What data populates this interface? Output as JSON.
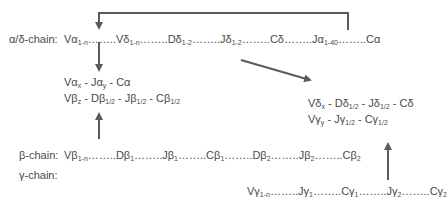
{
  "diagram": {
    "title": "",
    "colors": {
      "text": "#4a4a4a",
      "arrow": "#5a5a5a",
      "background": "#ffffff"
    },
    "alpha_delta_chain": {
      "label": "α/δ-chain:",
      "segments": [
        {
          "base": "Vα",
          "sub": "1-n"
        },
        {
          "base": "Vδ",
          "sub": "1-n"
        },
        {
          "base": "Dδ",
          "sub": "1-2"
        },
        {
          "base": "Jδ",
          "sub": "1-2"
        },
        {
          "base": "Cδ",
          "sub": ""
        },
        {
          "base": "Jα",
          "sub": "1-40"
        },
        {
          "base": "Cα",
          "sub": ""
        }
      ],
      "separator": "……."
    },
    "beta_chain": {
      "label": "β-chain:",
      "segments": [
        {
          "base": "Vβ",
          "sub": "1-n"
        },
        {
          "base": "Dβ",
          "sub": "1"
        },
        {
          "base": "Jβ",
          "sub": "1"
        },
        {
          "base": "Cβ",
          "sub": "1"
        },
        {
          "base": "Dβ",
          "sub": "2"
        },
        {
          "base": "Jβ",
          "sub": "2"
        },
        {
          "base": "Cβ",
          "sub": "2"
        }
      ]
    },
    "gamma_chain": {
      "label": "γ-chain:",
      "segments": [
        {
          "base": "Vγ",
          "sub": "1-n"
        },
        {
          "base": "Jγ",
          "sub": "1"
        },
        {
          "base": "Cγ",
          "sub": "1"
        },
        {
          "base": "Jγ",
          "sub": "2"
        },
        {
          "base": "Cγ",
          "sub": "2"
        }
      ]
    },
    "rearranged_alpha_beta": {
      "alpha": [
        {
          "base": "Vα",
          "sub": "x"
        },
        {
          "base": "Jα",
          "sub": "y"
        },
        {
          "base": "Cα",
          "sub": ""
        }
      ],
      "beta": [
        {
          "base": "Vβ",
          "sub": "z"
        },
        {
          "base": "Dβ",
          "sub": "1/2"
        },
        {
          "base": "Jβ",
          "sub": "1/2"
        },
        {
          "base": "Cβ",
          "sub": "1/2"
        }
      ]
    },
    "rearranged_gamma_delta": {
      "delta": [
        {
          "base": "Vδ",
          "sub": "x"
        },
        {
          "base": "Dδ",
          "sub": "1/2"
        },
        {
          "base": "Jδ",
          "sub": "1/2"
        },
        {
          "base": "Cδ",
          "sub": ""
        }
      ],
      "gamma": [
        {
          "base": "Vγ",
          "sub": "y"
        },
        {
          "base": "Jγ",
          "sub": "1/2"
        },
        {
          "base": "Cγ",
          "sub": "1/2"
        }
      ]
    },
    "dots": "……..",
    "dash": " - "
  }
}
